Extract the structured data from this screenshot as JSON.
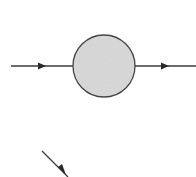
{
  "diagram": {
    "type": "propagator-blob",
    "colors": {
      "line": "#3a3a3a",
      "blob_fill": "#d8d8d8",
      "blob_stroke": "#444444"
    },
    "blob": {
      "cx": 104,
      "cy": 66,
      "r": 31
    },
    "lines": [
      {
        "name": "incoming-line",
        "x1": 11,
        "y1": 66,
        "x2": 73,
        "y2": 66,
        "arrow_at": 43
      },
      {
        "name": "outgoing-line",
        "x1": 135,
        "y1": 66,
        "x2": 196,
        "y2": 66,
        "arrow_at": 165
      },
      {
        "name": "diagonal-line",
        "x1": 42,
        "y1": 151,
        "x2": 68,
        "y2": 177,
        "arrow_at": 62
      }
    ]
  }
}
